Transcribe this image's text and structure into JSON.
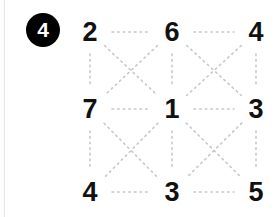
{
  "badge": {
    "label": "4",
    "shape": "circle",
    "background": "#000000",
    "text_color": "#ffffff"
  },
  "diagram": {
    "type": "grid-puzzle",
    "rows": 3,
    "cols": 3,
    "line_style": "dotted",
    "line_color": "#c8c8c8",
    "background": "#ffffff",
    "node_color": "#111111",
    "nodes": [
      {
        "id": "r0c0",
        "value": "2",
        "x": 90,
        "y": 32
      },
      {
        "id": "r0c1",
        "value": "6",
        "x": 172,
        "y": 32
      },
      {
        "id": "r0c2",
        "value": "4",
        "x": 256,
        "y": 32
      },
      {
        "id": "r1c0",
        "value": "7",
        "x": 90,
        "y": 109
      },
      {
        "id": "r1c1",
        "value": "1",
        "x": 172,
        "y": 109
      },
      {
        "id": "r1c2",
        "value": "3",
        "x": 256,
        "y": 109
      },
      {
        "id": "r2c0",
        "value": "4",
        "x": 90,
        "y": 192
      },
      {
        "id": "r2c1",
        "value": "3",
        "x": 172,
        "y": 192
      },
      {
        "id": "r2c2",
        "value": "5",
        "x": 256,
        "y": 192
      }
    ],
    "grid_values": [
      [
        "2",
        "6",
        "4"
      ],
      [
        "7",
        "1",
        "3"
      ],
      [
        "4",
        "3",
        "5"
      ]
    ],
    "edges": [
      {
        "from": "r0c0",
        "to": "r0c1",
        "kind": "horizontal"
      },
      {
        "from": "r0c1",
        "to": "r0c2",
        "kind": "horizontal"
      },
      {
        "from": "r1c0",
        "to": "r1c1",
        "kind": "horizontal"
      },
      {
        "from": "r1c1",
        "to": "r1c2",
        "kind": "horizontal"
      },
      {
        "from": "r2c0",
        "to": "r2c1",
        "kind": "horizontal"
      },
      {
        "from": "r2c1",
        "to": "r2c2",
        "kind": "horizontal"
      },
      {
        "from": "r0c0",
        "to": "r1c0",
        "kind": "vertical"
      },
      {
        "from": "r0c1",
        "to": "r1c1",
        "kind": "vertical"
      },
      {
        "from": "r0c2",
        "to": "r1c2",
        "kind": "vertical"
      },
      {
        "from": "r1c0",
        "to": "r2c0",
        "kind": "vertical"
      },
      {
        "from": "r1c1",
        "to": "r2c1",
        "kind": "vertical"
      },
      {
        "from": "r1c2",
        "to": "r2c2",
        "kind": "vertical"
      },
      {
        "from": "r0c0",
        "to": "r1c1",
        "kind": "diagonal"
      },
      {
        "from": "r0c1",
        "to": "r1c0",
        "kind": "diagonal"
      },
      {
        "from": "r0c1",
        "to": "r1c2",
        "kind": "diagonal"
      },
      {
        "from": "r0c2",
        "to": "r1c1",
        "kind": "diagonal"
      },
      {
        "from": "r1c0",
        "to": "r2c1",
        "kind": "diagonal"
      },
      {
        "from": "r1c1",
        "to": "r2c0",
        "kind": "diagonal"
      },
      {
        "from": "r1c1",
        "to": "r2c2",
        "kind": "diagonal"
      },
      {
        "from": "r1c2",
        "to": "r2c1",
        "kind": "diagonal"
      }
    ]
  }
}
